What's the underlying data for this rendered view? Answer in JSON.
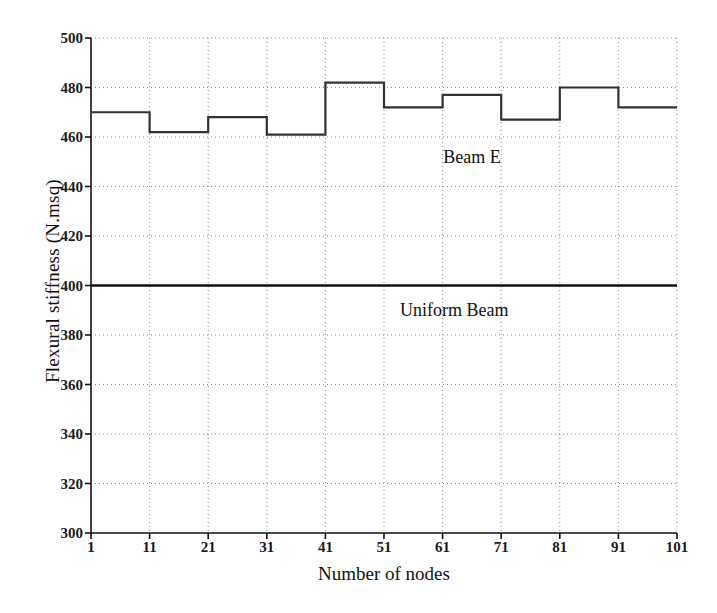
{
  "chart_data": {
    "type": "line",
    "title": "",
    "xlabel": "Number of nodes",
    "ylabel": "Flexural stiffness (N.msq)",
    "xlim": [
      1,
      101
    ],
    "ylim": [
      300,
      500
    ],
    "xticks": [
      1,
      11,
      21,
      31,
      41,
      51,
      61,
      71,
      81,
      91,
      101
    ],
    "xtick_labels": [
      "1",
      "11",
      "21",
      "31",
      "41",
      "51",
      "61",
      "71",
      "81",
      "91",
      "101"
    ],
    "yticks": [
      300,
      320,
      340,
      360,
      380,
      400,
      420,
      440,
      460,
      480,
      500
    ],
    "ytick_labels": [
      "300",
      "320",
      "340",
      "360",
      "380",
      "400",
      "420",
      "440",
      "460",
      "480",
      "500"
    ],
    "grid": "dotted",
    "legend_position": "inline-annotations",
    "series": [
      {
        "name": "Beam E",
        "style": "step",
        "color": "#333333",
        "x_edges": [
          1,
          11,
          21,
          31,
          41,
          51,
          61,
          71,
          81,
          91,
          101
        ],
        "values": [
          470,
          462,
          468,
          461,
          482,
          472,
          477,
          467,
          480,
          472
        ],
        "annotation": {
          "label": "Beam E",
          "x": 66,
          "y": 452
        }
      },
      {
        "name": "Uniform Beam",
        "style": "constant",
        "color": "#111111",
        "x_edges": [
          1,
          101
        ],
        "values": [
          400
        ],
        "annotation": {
          "label": "Uniform Beam",
          "x": 63,
          "y": 390
        }
      }
    ]
  },
  "axes": {
    "left_axis_x": 91,
    "right_axis_x": 677,
    "top_axis_y": 38,
    "bottom_axis_y": 533
  },
  "colors": {
    "axis": "#111111",
    "grid": "#8a8a8a",
    "beam_e": "#333333",
    "uniform_beam": "#111111",
    "background": "#ffffff"
  }
}
